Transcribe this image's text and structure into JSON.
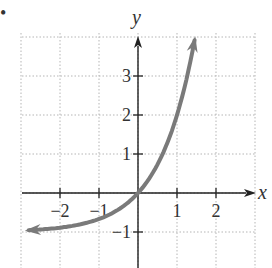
{
  "chart_data": {
    "type": "line",
    "title": "",
    "xlabel": "x",
    "ylabel": "y",
    "xlim": [
      -3,
      3
    ],
    "ylim": [
      -1.5,
      4
    ],
    "grid": true,
    "x_ticks": [
      -2,
      -1,
      1,
      2
    ],
    "y_ticks": [
      -1,
      1,
      2,
      3
    ],
    "x_tick_labels": [
      "−2",
      "−1",
      "1",
      "2"
    ],
    "y_tick_labels": [
      "−1",
      "1",
      "2",
      "3"
    ],
    "series": [
      {
        "name": "f(x) = 3^x - 1",
        "color": "#7a7a7a",
        "arrows_both_ends": true,
        "x": [
          -2.8,
          -2.5,
          -2,
          -1.5,
          -1,
          -0.5,
          0,
          0.5,
          1,
          1.25,
          1.45
        ],
        "y": [
          -0.95,
          -0.94,
          -0.89,
          -0.81,
          -0.67,
          -0.42,
          0,
          0.73,
          2,
          2.95,
          3.92
        ]
      }
    ],
    "horizontal_asymptote": -1
  },
  "figure": {
    "bullet": "•"
  },
  "colors": {
    "curve": "#7a7a7a",
    "axes": "#222222",
    "grid": "#b5b5b5"
  }
}
